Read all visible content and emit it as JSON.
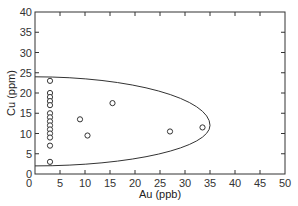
{
  "chart_data": {
    "type": "scatter",
    "title": "",
    "xlabel": "Au (ppb)",
    "ylabel": "Cu (ppm)",
    "xlim": [
      0,
      50
    ],
    "ylim": [
      0,
      40
    ],
    "xticks": [
      0,
      5,
      10,
      15,
      20,
      25,
      30,
      35,
      40,
      45,
      50
    ],
    "yticks": [
      0,
      5,
      10,
      15,
      20,
      25,
      30,
      35,
      40
    ],
    "grid": false,
    "legend": null,
    "series": [
      {
        "name": "samples",
        "marker": "open-circle",
        "points": [
          {
            "x": 3,
            "y": 23
          },
          {
            "x": 3,
            "y": 20
          },
          {
            "x": 3,
            "y": 19
          },
          {
            "x": 3,
            "y": 18
          },
          {
            "x": 3,
            "y": 17
          },
          {
            "x": 3,
            "y": 15
          },
          {
            "x": 3,
            "y": 14
          },
          {
            "x": 3,
            "y": 13
          },
          {
            "x": 3,
            "y": 12
          },
          {
            "x": 3,
            "y": 11
          },
          {
            "x": 3,
            "y": 10
          },
          {
            "x": 3,
            "y": 9
          },
          {
            "x": 3,
            "y": 7
          },
          {
            "x": 3,
            "y": 3
          },
          {
            "x": 9,
            "y": 13.5
          },
          {
            "x": 10.5,
            "y": 9.5
          },
          {
            "x": 15.5,
            "y": 17.5
          },
          {
            "x": 27,
            "y": 10.5
          },
          {
            "x": 33.5,
            "y": 11.5
          }
        ]
      }
    ],
    "annotations": [
      {
        "type": "half-ellipse",
        "description": "envelope enclosing data",
        "x_left": 0,
        "x_right": 35,
        "y_top": 24,
        "y_bottom": 2,
        "y_center": 12
      }
    ]
  },
  "axes": {
    "x_label": "Au (ppb)",
    "y_label": "Cu (ppm)",
    "x_tick_labels": [
      "0",
      "5",
      "10",
      "15",
      "20",
      "25",
      "30",
      "35",
      "40",
      "45",
      "50"
    ],
    "y_tick_labels": [
      "0",
      "5",
      "10",
      "15",
      "20",
      "25",
      "30",
      "35",
      "40"
    ]
  }
}
